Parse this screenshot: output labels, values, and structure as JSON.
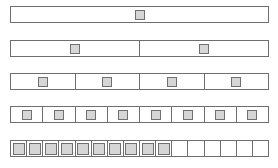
{
  "diagram": {
    "colors": {
      "border": "#6e6e6e",
      "square_fill": "#d6d6d6",
      "square_border": "#707070",
      "background": "#ffffff"
    },
    "rows": [
      {
        "id": "row-1",
        "top": 6,
        "cells": 1,
        "filled": 1
      },
      {
        "id": "row-2",
        "top": 40,
        "cells": 2,
        "filled": 2
      },
      {
        "id": "row-3",
        "top": 73,
        "cells": 4,
        "filled": 4
      },
      {
        "id": "row-4",
        "top": 106,
        "cells": 8,
        "filled": 8
      },
      {
        "id": "row-5",
        "top": 140,
        "cells": 16,
        "filled": 10
      }
    ]
  }
}
